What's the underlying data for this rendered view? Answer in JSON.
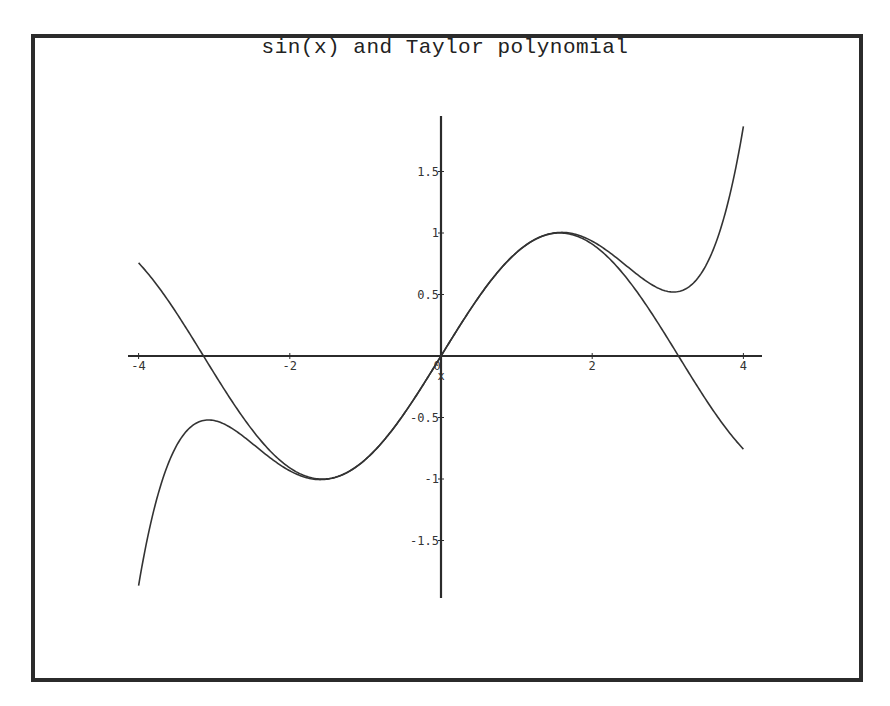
{
  "chart_data": {
    "type": "line",
    "title": "sin(x) and Taylor polynomial",
    "xlabel": "x",
    "ylabel": "",
    "xlim": [
      -4,
      4
    ],
    "ylim": [
      -1.95,
      1.95
    ],
    "grid": false,
    "legend": null,
    "x_ticks": [
      -4,
      -2,
      0,
      2,
      4
    ],
    "x_tick_labels": [
      "-4",
      "-2",
      "0",
      "2",
      "4"
    ],
    "y_ticks": [
      -1.5,
      -1,
      -0.5,
      0.5,
      1,
      1.5
    ],
    "y_tick_labels": [
      "-1.5",
      "-1",
      "-0.5",
      "0.5",
      "1",
      "1.5"
    ],
    "series": [
      {
        "name": "sin(x)",
        "expression": "sin(x)",
        "x": [
          -4,
          -3,
          -2,
          -1.5708,
          -1,
          0,
          1,
          1.5708,
          2,
          3,
          4
        ],
        "values": [
          0.757,
          -0.141,
          -0.909,
          -1.0,
          -0.841,
          0,
          0.841,
          1.0,
          0.909,
          0.141,
          -0.757
        ]
      },
      {
        "name": "Taylor polynomial",
        "expression": "x - x^3/6 + x^5/120",
        "x": [
          -4,
          -3,
          -2.5,
          -2,
          -1,
          0,
          1,
          2,
          2.5,
          3,
          4
        ],
        "values": [
          -1.867,
          -0.525,
          -0.583,
          -0.933,
          -0.842,
          0,
          0.842,
          0.933,
          0.583,
          0.525,
          1.867
        ]
      }
    ],
    "colors": {
      "axes": "#2b2b2b",
      "curve": "#333333",
      "frame": "#2b2b2b"
    }
  }
}
